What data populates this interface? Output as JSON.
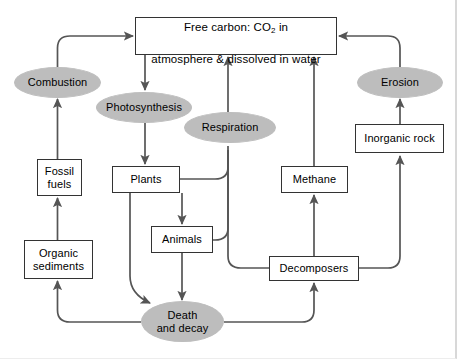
{
  "diagram": {
    "palette": {
      "background": "#ffffff",
      "box_fill": "#ffffff",
      "box_stroke": "#333333",
      "ellipse_fill": "#bdbdbd",
      "arrow_stroke": "#555555",
      "text": "#000000"
    },
    "nodes": [
      {
        "id": "free-carbon",
        "label_line1": "Free carbon: CO",
        "label_sub": "2",
        "label_line1_tail": " in",
        "label_line2": "atmosphere & dissolved in water",
        "shape": "box",
        "x": 135,
        "y": 17,
        "w": 202,
        "h": 38
      },
      {
        "id": "combustion",
        "label": "Combustion",
        "shape": "ellipse",
        "x": 14,
        "y": 67,
        "w": 87,
        "h": 31
      },
      {
        "id": "photosynthesis",
        "label": "Photosynthesis",
        "shape": "ellipse",
        "x": 96,
        "y": 92,
        "w": 96,
        "h": 31
      },
      {
        "id": "respiration",
        "label": "Respiration",
        "shape": "ellipse",
        "x": 184,
        "y": 112,
        "w": 92,
        "h": 31
      },
      {
        "id": "erosion",
        "label": "Erosion",
        "shape": "ellipse",
        "x": 357,
        "y": 67,
        "w": 86,
        "h": 31
      },
      {
        "id": "inorganic-rock",
        "label": "Inorganic rock",
        "shape": "box",
        "x": 355,
        "y": 124,
        "w": 89,
        "h": 29
      },
      {
        "id": "fossil-fuels",
        "label": "Fossil\nfuels",
        "shape": "box",
        "x": 37,
        "y": 159,
        "w": 45,
        "h": 37
      },
      {
        "id": "plants",
        "label": "Plants",
        "shape": "box",
        "x": 112,
        "y": 166,
        "w": 68,
        "h": 27
      },
      {
        "id": "animals",
        "label": "Animals",
        "shape": "box",
        "x": 151,
        "y": 226,
        "w": 62,
        "h": 27
      },
      {
        "id": "methane",
        "label": "Methane",
        "shape": "box",
        "x": 281,
        "y": 166,
        "w": 67,
        "h": 27
      },
      {
        "id": "organic-sediments",
        "label": "Organic\nsediments",
        "shape": "box",
        "x": 24,
        "y": 240,
        "w": 69,
        "h": 39
      },
      {
        "id": "decomposers",
        "label": "Decomposers",
        "shape": "box",
        "x": 269,
        "y": 256,
        "w": 90,
        "h": 25
      },
      {
        "id": "death-and-decay",
        "label": "Death\nand decay",
        "shape": "ellipse",
        "x": 141,
        "y": 301,
        "w": 83,
        "h": 41
      }
    ],
    "edges": [
      {
        "id": "combustion-to-free-carbon",
        "from": "combustion",
        "to": "free-carbon"
      },
      {
        "id": "free-carbon-to-photosynthesis",
        "from": "free-carbon",
        "to": "photosynthesis"
      },
      {
        "id": "photosynthesis-to-plants",
        "from": "photosynthesis",
        "to": "plants"
      },
      {
        "id": "respiration-to-free-carbon",
        "from": "respiration",
        "to": "free-carbon"
      },
      {
        "id": "plants-to-respiration",
        "from": "plants",
        "to": "respiration"
      },
      {
        "id": "animals-to-respiration",
        "from": "animals",
        "to": "respiration"
      },
      {
        "id": "decomposers-to-respiration",
        "from": "decomposers",
        "to": "respiration"
      },
      {
        "id": "plants-to-animals",
        "from": "plants",
        "to": "animals"
      },
      {
        "id": "plants-to-death-and-decay",
        "from": "plants",
        "to": "death-and-decay"
      },
      {
        "id": "animals-to-death-and-decay",
        "from": "animals",
        "to": "death-and-decay"
      },
      {
        "id": "death-and-decay-to-organic-sediments",
        "from": "death-and-decay",
        "to": "organic-sediments"
      },
      {
        "id": "death-and-decay-to-decomposers",
        "from": "death-and-decay",
        "to": "decomposers"
      },
      {
        "id": "organic-sediments-to-fossil-fuels",
        "from": "organic-sediments",
        "to": "fossil-fuels"
      },
      {
        "id": "fossil-fuels-to-combustion",
        "from": "fossil-fuels",
        "to": "combustion"
      },
      {
        "id": "decomposers-to-methane",
        "from": "decomposers",
        "to": "methane"
      },
      {
        "id": "methane-to-free-carbon",
        "from": "methane",
        "to": "free-carbon"
      },
      {
        "id": "decomposers-to-inorganic-rock",
        "from": "decomposers",
        "to": "inorganic-rock"
      },
      {
        "id": "inorganic-rock-to-erosion",
        "from": "inorganic-rock",
        "to": "erosion"
      },
      {
        "id": "erosion-to-free-carbon",
        "from": "erosion",
        "to": "free-carbon"
      }
    ]
  }
}
